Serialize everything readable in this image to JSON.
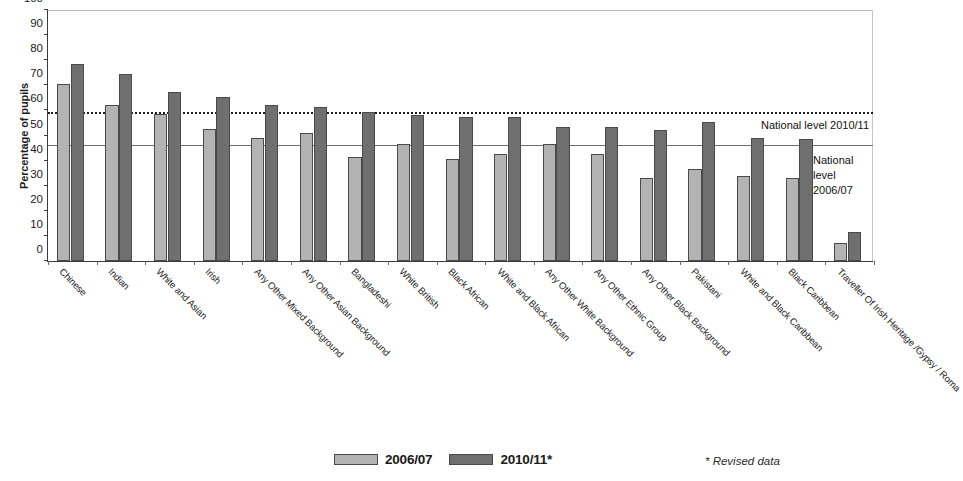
{
  "chart_data": {
    "type": "bar",
    "title": "",
    "xlabel": "",
    "ylabel": "Percentage of pupils",
    "ylim": [
      0,
      100
    ],
    "ytick_step": 10,
    "yticks": [
      "0",
      "10",
      "20",
      "30",
      "40",
      "50",
      "60",
      "70",
      "80",
      "90",
      "100"
    ],
    "grid": false,
    "legend_position": "bottom-center",
    "categories": [
      "Chinese",
      "Indian",
      "White and Asian",
      "Irish",
      "Any Other Mixed Background",
      "Any Other Asian Background",
      "Bangladeshi",
      "White British",
      "Black African",
      "White and Black African",
      "Any Other White Background",
      "Any Other Ethnic Group",
      "Any Other Black Background",
      "Pakistani",
      "White and Black Caribbean",
      "Black Caribbean",
      "Traveller Of Irish Heritage /Gypsy / Roma"
    ],
    "series": [
      {
        "name": "2006/07",
        "color": "#b3b3b3",
        "values": [
          70.5,
          62.0,
          58.5,
          52.5,
          49.0,
          51.0,
          41.5,
          46.5,
          40.5,
          42.5,
          46.5,
          42.5,
          33.0,
          36.5,
          34.0,
          33.0,
          7.0
        ]
      },
      {
        "name": "2010/11*",
        "color": "#6f6f6f",
        "values": [
          78.5,
          74.5,
          67.5,
          65.5,
          62.0,
          61.5,
          59.5,
          58.0,
          57.5,
          57.5,
          53.5,
          53.5,
          52.0,
          55.5,
          49.0,
          48.5,
          11.5
        ]
      }
    ],
    "reference_lines": [
      {
        "id": "national-2010",
        "value": 58.5,
        "style": "dotted",
        "label": "National level 2010/11"
      },
      {
        "id": "national-2006",
        "value": 46.0,
        "style": "solid",
        "label": "National\nlevel\n2006/07"
      }
    ]
  },
  "axis": {
    "y_title": "Percentage of pupils"
  },
  "annotations": {
    "national_2010_label": "National level 2010/11",
    "national_2006_line1": "National",
    "national_2006_line2": "level",
    "national_2006_line3": "2006/07"
  },
  "legend": {
    "items": [
      {
        "label": "2006/07",
        "color": "#b3b3b3"
      },
      {
        "label": "2010/11*",
        "color": "#6f6f6f"
      }
    ]
  },
  "footnote": {
    "text": "* Revised data"
  }
}
